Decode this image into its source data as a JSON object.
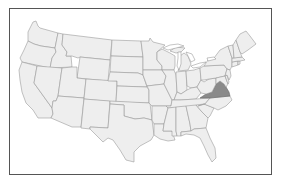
{
  "map": {
    "title": "United States",
    "highlighted_state": "Virginia",
    "colors": {
      "state_fill": "#eeeeee",
      "state_border": "#9a9a9a",
      "highlight_fill": "#8a8a8a",
      "frame_border": "#555555",
      "background": "#ffffff"
    },
    "states": [
      "Washington",
      "Oregon",
      "California",
      "Idaho",
      "Nevada",
      "Montana",
      "Wyoming",
      "Utah",
      "Arizona",
      "Colorado",
      "New Mexico",
      "North Dakota",
      "South Dakota",
      "Nebraska",
      "Kansas",
      "Oklahoma",
      "Texas",
      "Minnesota",
      "Iowa",
      "Missouri",
      "Arkansas",
      "Louisiana",
      "Wisconsin",
      "Illinois",
      "Michigan",
      "Indiana",
      "Ohio",
      "Kentucky",
      "Tennessee",
      "Mississippi",
      "Alabama",
      "Georgia",
      "Florida",
      "South Carolina",
      "North Carolina",
      "Virginia",
      "West Virginia",
      "Pennsylvania",
      "New York",
      "Maryland",
      "Delaware",
      "New Jersey",
      "Connecticut",
      "Rhode Island",
      "Massachusetts",
      "Vermont",
      "New Hampshire",
      "Maine"
    ]
  }
}
